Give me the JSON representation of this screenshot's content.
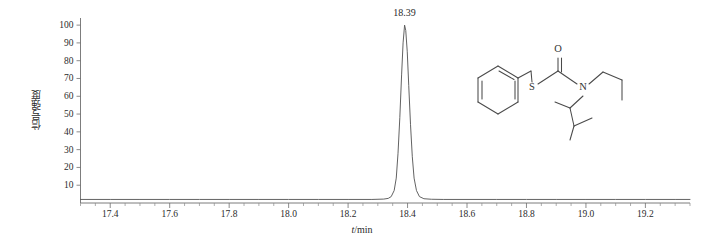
{
  "chart_data": {
    "type": "line",
    "title": "",
    "xlabel": "t/min",
    "ylabel": "信号强度",
    "xlabel_italic_part": "t",
    "xlabel_rest": "/min",
    "xlim": [
      17.3,
      19.35
    ],
    "ylim": [
      0,
      104
    ],
    "grid": false,
    "legend": null,
    "x_ticks": [
      17.4,
      17.6,
      17.8,
      18.0,
      18.2,
      18.4,
      18.6,
      18.8,
      19.0,
      19.2
    ],
    "x_tick_labels": [
      "17.4",
      "17.6",
      "17.8",
      "18.0",
      "18.2",
      "18.4",
      "18.6",
      "18.8",
      "19.0",
      "19.2"
    ],
    "y_ticks": [
      10,
      20,
      30,
      40,
      50,
      60,
      70,
      80,
      90,
      100
    ],
    "y_tick_labels": [
      "10",
      "20",
      "30",
      "40",
      "50",
      "60",
      "70",
      "80",
      "90",
      "100"
    ],
    "annotations": [
      {
        "text": "18.39",
        "x": 18.39,
        "y": 100
      }
    ],
    "series": [
      {
        "name": "TIC",
        "peak_retention_time": 18.39,
        "peak_height": 100,
        "baseline": 2,
        "peak_width_half_max": 0.022,
        "x": [
          17.3,
          17.4,
          17.5,
          17.6,
          17.7,
          17.8,
          17.9,
          18.0,
          18.1,
          18.2,
          18.28,
          18.32,
          18.335,
          18.345,
          18.355,
          18.362,
          18.368,
          18.374,
          18.38,
          18.385,
          18.39,
          18.394,
          18.399,
          18.404,
          18.41,
          18.416,
          18.422,
          18.43,
          18.44,
          18.455,
          18.48,
          18.52,
          18.6,
          18.7,
          18.8,
          18.9,
          19.0,
          19.1,
          19.2,
          19.3,
          19.35
        ],
        "y": [
          2,
          2,
          2,
          2,
          2,
          2,
          2,
          2,
          2,
          2,
          2,
          2.2,
          2.6,
          3.6,
          7,
          14,
          28,
          48,
          72,
          90,
          100,
          97,
          85,
          66,
          44,
          26,
          14,
          7,
          3.6,
          2.4,
          2.1,
          2,
          2,
          2,
          2,
          2,
          2,
          2,
          2,
          2,
          2
        ]
      }
    ]
  },
  "molecule": {
    "name": "benzyl N-ethyl-N-(3-methylbutan-2-yl)carbamothioate",
    "atom_labels": [
      {
        "symbol": "S",
        "x": 62,
        "y": 50
      },
      {
        "symbol": "O",
        "x": 88,
        "y": 12
      },
      {
        "symbol": "N",
        "x": 113,
        "y": 50
      }
    ]
  }
}
